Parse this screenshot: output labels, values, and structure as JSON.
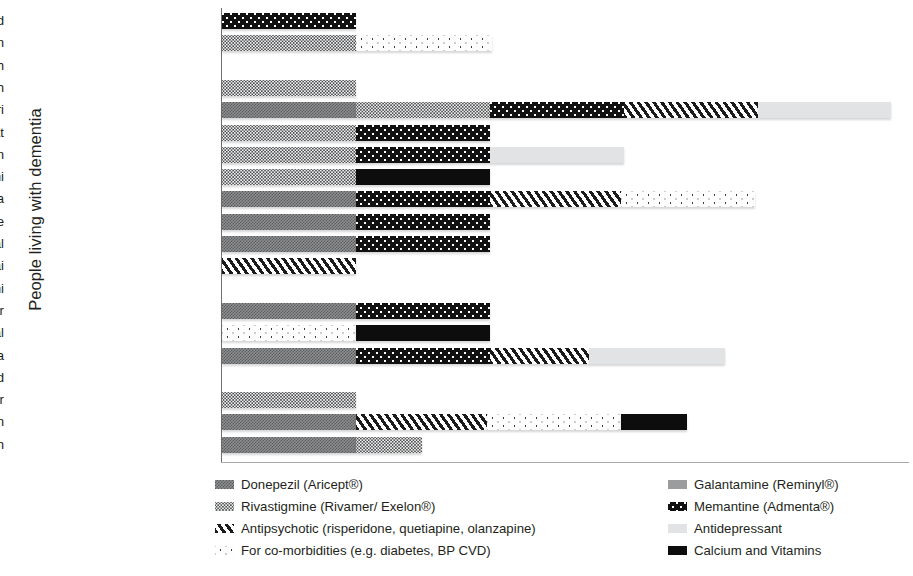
{
  "axis": {
    "y_title": "People living with dementia"
  },
  "legend": {
    "left": [
      {
        "key": "donepezil",
        "label": "Donepezil (Aricept®)",
        "pattern": "p-donepezil"
      },
      {
        "key": "rivastigmine",
        "label": "Rivastigmine (Rivamer/ Exelon®)",
        "pattern": "p-rivastigmine"
      },
      {
        "key": "antipsychotic",
        "label": "Antipsychotic (risperidone, quetiapine, olanzapine)",
        "pattern": "p-antipsychotic"
      },
      {
        "key": "comorbid",
        "label": "For co-morbidities (e.g. diabetes, BP CVD)",
        "pattern": "p-comorbid"
      }
    ],
    "right": [
      {
        "key": "galantamine",
        "label": "Galantamine (Reminyl®)",
        "pattern": "p-galantamine"
      },
      {
        "key": "memantine",
        "label": "Memantine (Admenta®)",
        "pattern": "p-memantine"
      },
      {
        "key": "antidepressant",
        "label": "Antidepressant",
        "pattern": "p-antidepressant"
      },
      {
        "key": "calcium",
        "label": "Calcium and Vitamins",
        "pattern": "p-calcium"
      }
    ]
  },
  "chart_data": {
    "type": "bar",
    "title": "",
    "xlabel": "",
    "ylabel": "People living with dementia",
    "orientation": "horizontal",
    "stacked": true,
    "grid": false,
    "legend_position": "bottom",
    "axis_units": "relative bar length (pixels of drawn segment)",
    "series_order": [
      "donepezil",
      "rivastigmine",
      "antipsychotic",
      "comorbid",
      "galantamine",
      "memantine",
      "antidepressant",
      "calcium"
    ],
    "categories": [
      "Anjeli Sood",
      "Omar Khan",
      "Harinder Singh",
      "Surinder Dharam Singh",
      "Shanti Hamdari",
      "Karanjit Bhagat",
      "Sheila Tandon",
      "H.P. Sadhwani",
      "A.P. Arora",
      "Dr Gautam Mukherjee",
      "Tara Jaiswal",
      "S.T. Pillai",
      "C.K. Sethi",
      "Lakshmi Kumari Kochar",
      "K.P. Aggarwal",
      "Meera Chopra",
      "Helen Meena Chand",
      "Sudhanshu Talwar",
      "K.T. Menon",
      "Meenakshi Ranjarajan"
    ],
    "rows": [
      {
        "name": "Anjeli Sood",
        "segments": [
          {
            "key": "memantine",
            "pattern": "p-memantine",
            "width": 134
          }
        ]
      },
      {
        "name": "Omar Khan",
        "segments": [
          {
            "key": "rivastigmine",
            "pattern": "p-rivastigmine",
            "width": 134
          },
          {
            "key": "comorbid",
            "pattern": "p-comorbid",
            "width": 136
          }
        ]
      },
      {
        "name": "Harinder Singh",
        "segments": []
      },
      {
        "name": "Surinder Dharam Singh",
        "segments": [
          {
            "key": "rivastigmine",
            "pattern": "p-rivastigmine",
            "width": 134
          }
        ]
      },
      {
        "name": "Shanti Hamdari",
        "segments": [
          {
            "key": "donepezil",
            "pattern": "p-donepezil",
            "width": 134
          },
          {
            "key": "rivastigmine",
            "pattern": "p-rivastigmine",
            "width": 134
          },
          {
            "key": "memantine",
            "pattern": "p-memantine",
            "width": 134
          },
          {
            "key": "antipsychotic",
            "pattern": "p-antipsychotic",
            "width": 134
          },
          {
            "key": "antidepressant",
            "pattern": "p-antidepressant",
            "width": 133
          }
        ]
      },
      {
        "name": "Karanjit Bhagat",
        "segments": [
          {
            "key": "rivastigmine",
            "pattern": "p-rivastigmine",
            "width": 134
          },
          {
            "key": "memantine",
            "pattern": "p-memantine",
            "width": 134
          }
        ]
      },
      {
        "name": "Sheila Tandon",
        "segments": [
          {
            "key": "rivastigmine",
            "pattern": "p-rivastigmine",
            "width": 134
          },
          {
            "key": "memantine",
            "pattern": "p-memantine",
            "width": 134
          },
          {
            "key": "antidepressant",
            "pattern": "p-antidepressant",
            "width": 134
          }
        ]
      },
      {
        "name": "H.P. Sadhwani",
        "segments": [
          {
            "key": "rivastigmine",
            "pattern": "p-rivastigmine",
            "width": 134
          },
          {
            "key": "calcium",
            "pattern": "p-calcium",
            "width": 134
          }
        ]
      },
      {
        "name": "A.P. Arora",
        "segments": [
          {
            "key": "donepezil",
            "pattern": "p-donepezil",
            "width": 134
          },
          {
            "key": "memantine",
            "pattern": "p-memantine",
            "width": 134
          },
          {
            "key": "antipsychotic",
            "pattern": "p-antipsychotic",
            "width": 131
          },
          {
            "key": "comorbid",
            "pattern": "p-comorbid",
            "width": 134
          }
        ]
      },
      {
        "name": "Dr Gautam Mukherjee",
        "segments": [
          {
            "key": "donepezil",
            "pattern": "p-donepezil",
            "width": 134
          },
          {
            "key": "memantine",
            "pattern": "p-memantine",
            "width": 134
          }
        ]
      },
      {
        "name": "Tara Jaiswal",
        "segments": [
          {
            "key": "donepezil",
            "pattern": "p-donepezil",
            "width": 134
          },
          {
            "key": "memantine",
            "pattern": "p-memantine",
            "width": 134
          }
        ]
      },
      {
        "name": "S.T. Pillai",
        "segments": [
          {
            "key": "antipsychotic",
            "pattern": "p-antipsychotic",
            "width": 134
          }
        ]
      },
      {
        "name": "C.K. Sethi",
        "segments": []
      },
      {
        "name": "Lakshmi Kumari Kochar",
        "segments": [
          {
            "key": "donepezil",
            "pattern": "p-donepezil",
            "width": 134
          },
          {
            "key": "memantine",
            "pattern": "p-memantine",
            "width": 134
          }
        ]
      },
      {
        "name": "K.P. Aggarwal",
        "segments": [
          {
            "key": "comorbid",
            "pattern": "p-comorbid",
            "width": 134
          },
          {
            "key": "calcium",
            "pattern": "p-calcium",
            "width": 134
          }
        ]
      },
      {
        "name": "Meera Chopra",
        "segments": [
          {
            "key": "donepezil",
            "pattern": "p-donepezil",
            "width": 134
          },
          {
            "key": "memantine",
            "pattern": "p-memantine",
            "width": 134
          },
          {
            "key": "antipsychotic",
            "pattern": "p-antipsychotic",
            "width": 99
          },
          {
            "key": "antidepressant",
            "pattern": "p-antidepressant",
            "width": 136
          }
        ]
      },
      {
        "name": "Helen Meena Chand",
        "segments": []
      },
      {
        "name": "Sudhanshu Talwar",
        "segments": [
          {
            "key": "rivastigmine",
            "pattern": "p-rivastigmine",
            "width": 134
          }
        ]
      },
      {
        "name": "K.T. Menon",
        "segments": [
          {
            "key": "donepezil",
            "pattern": "p-donepezil",
            "width": 134
          },
          {
            "key": "antipsychotic",
            "pattern": "p-antipsychotic",
            "width": 131
          },
          {
            "key": "comorbid",
            "pattern": "p-comorbid",
            "width": 134
          },
          {
            "key": "calcium",
            "pattern": "p-calcium",
            "width": 66
          }
        ]
      },
      {
        "name": "Meenakshi Ranjarajan",
        "segments": [
          {
            "key": "donepezil",
            "pattern": "p-donepezil",
            "width": 134
          },
          {
            "key": "rivastigmine",
            "pattern": "p-rivastigmine",
            "width": 66
          }
        ]
      }
    ]
  }
}
